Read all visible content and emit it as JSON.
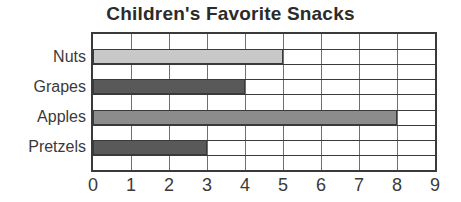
{
  "chart_data": {
    "type": "bar",
    "orientation": "horizontal",
    "title": "Children's Favorite Snacks",
    "xlabel": "",
    "ylabel": "",
    "xlim": [
      0,
      9
    ],
    "xticks": [
      "0",
      "1",
      "2",
      "3",
      "4",
      "5",
      "6",
      "7",
      "8",
      "9"
    ],
    "grid": true,
    "legend": false,
    "categories": [
      "Nuts",
      "Grapes",
      "Apples",
      "Pretzels"
    ],
    "values": [
      5,
      4,
      8,
      3
    ],
    "bar_colors": [
      "#c8c8c8",
      "#595959",
      "#8c8c8c",
      "#595959"
    ],
    "bars": [
      {
        "category": "Nuts",
        "value": 5,
        "color": "#c8c8c8"
      },
      {
        "category": "Grapes",
        "value": 4,
        "color": "#595959"
      },
      {
        "category": "Apples",
        "value": 8,
        "color": "#8c8c8c"
      },
      {
        "category": "Pretzels",
        "value": 3,
        "color": "#595959"
      }
    ]
  },
  "style": {
    "title_color": "#2b2b2b",
    "label_color": "#3a3a3a",
    "frame_color": "#3a3a3a",
    "gridline_color": "#6f6f6f",
    "background": "#ffffff"
  }
}
